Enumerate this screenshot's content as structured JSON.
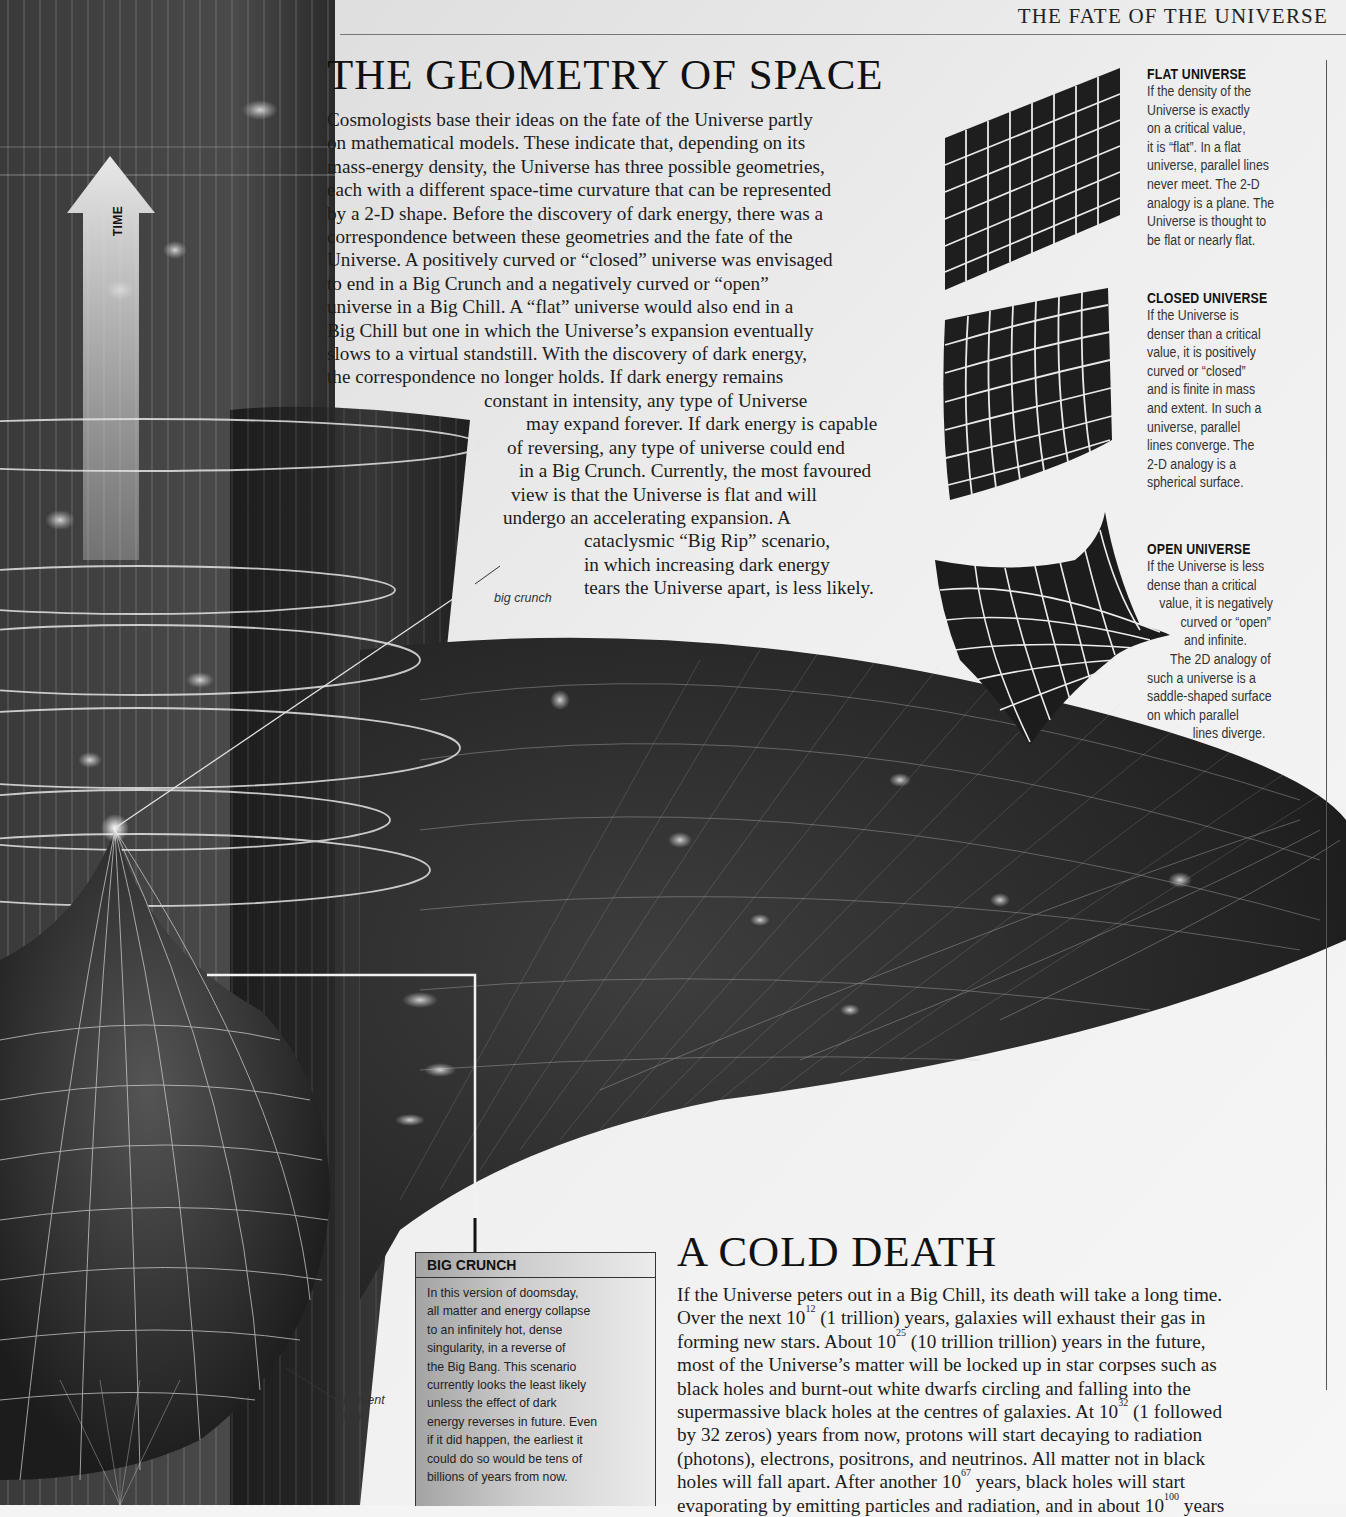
{
  "running_head": "THE FATE OF THE UNIVERSE",
  "illustration": {
    "time_arrow_label": "TIME",
    "labels": {
      "big_crunch": "big crunch",
      "present_day_line1": "present",
      "present_day_line2": "day"
    }
  },
  "geometry_section": {
    "title": "THE GEOMETRY OF SPACE",
    "paragraph_lines": [
      "Cosmologists base their ideas on the fate of the Universe partly",
      "on mathematical models. These indicate that, depending on its",
      "mass-energy density, the Universe has three possible geometries,",
      "each with a different space-time curvature that can be represented",
      "by a 2-D shape. Before the discovery of dark energy, there was a",
      "correspondence between these geometries and the fate of the",
      "Universe. A positively curved or “closed” universe was envisaged",
      "to end in a Big Crunch and a negatively curved or “open”",
      "universe in a Big Chill. A “flat” universe would also end in a",
      "Big Chill but one in which the Universe’s expansion eventually",
      "slows to a virtual standstill. With the discovery of dark energy,",
      "the correspondence no longer holds. If dark energy remains",
      "constant in intensity, any type of Universe",
      "may expand forever. If dark energy is capable",
      "of reversing, any type of universe could end",
      "in a Big Crunch. Currently, the most favoured",
      "view is that the Universe is flat and will",
      "undergo an accelerating expansion. A",
      "cataclysmic “Big Rip” scenario,",
      "in which increasing dark energy",
      "tears the Universe apart, is less likely."
    ]
  },
  "sidebar": {
    "flat": {
      "title": "FLAT UNIVERSE",
      "lines": [
        "If the density of the",
        "Universe is exactly",
        "on a critical value,",
        "it is “flat”. In a flat",
        "universe, parallel lines",
        "never meet. The 2-D",
        "analogy is a plane. The",
        "Universe is thought to",
        "be flat or nearly flat."
      ]
    },
    "closed": {
      "title": "CLOSED UNIVERSE",
      "lines": [
        "If the Universe is",
        "denser than a critical",
        "value, it is positively",
        "curved or “closed”",
        "and is finite in mass",
        "and extent. In such a",
        "universe, parallel",
        "lines converge. The",
        "2-D analogy is a",
        "spherical surface."
      ]
    },
    "open": {
      "title": "OPEN UNIVERSE",
      "lines": [
        "If the Universe is less",
        "dense than a critical",
        "value, it is negatively",
        "curved or “open”",
        "and infinite.",
        "The 2D analogy of",
        "such a universe is a",
        "saddle-shaped surface",
        "on which parallel",
        "lines diverge."
      ]
    }
  },
  "big_crunch_box": {
    "title": "BIG CRUNCH",
    "lines": [
      "In this version of doomsday,",
      "all matter and energy collapse",
      "to an infinitely hot, dense",
      "singularity, in a reverse of",
      "the Big Bang. This scenario",
      "currently looks the least likely",
      "unless the effect of dark",
      "energy reverses in future. Even",
      "if it did happen, the earliest it",
      "could do so would be tens of",
      "billions of years from now."
    ]
  },
  "cold_death_section": {
    "title": "A COLD DEATH",
    "lines": [
      {
        "pre": "If the Universe peters out in a Big Chill, its death will take a long time.",
        "sup": "",
        "post": ""
      },
      {
        "pre": "Over the next 10",
        "sup": "12",
        "post": " (1 trillion) years, galaxies will exhaust their gas in"
      },
      {
        "pre": "forming new stars. About 10",
        "sup": "25",
        "post": " (10 trillion trillion) years in the future,"
      },
      {
        "pre": "most of the Universe’s matter will be locked up in star corpses such as",
        "sup": "",
        "post": ""
      },
      {
        "pre": "black holes and burnt-out white dwarfs circling and falling into the",
        "sup": "",
        "post": ""
      },
      {
        "pre": "supermassive black holes at the centres of galaxies. At 10",
        "sup": "32",
        "post": " (1 followed"
      },
      {
        "pre": "by 32 zeros) years from now, protons will start decaying to radiation",
        "sup": "",
        "post": ""
      },
      {
        "pre": "(photons), electrons, positrons, and neutrinos. All matter not in black",
        "sup": "",
        "post": ""
      },
      {
        "pre": "holes will fall apart. After another 10",
        "sup": "67",
        "post": " years, black holes will start"
      },
      {
        "pre": "evaporating by emitting particles and radiation, and in about 10",
        "sup": "100",
        "post": " years"
      }
    ]
  }
}
